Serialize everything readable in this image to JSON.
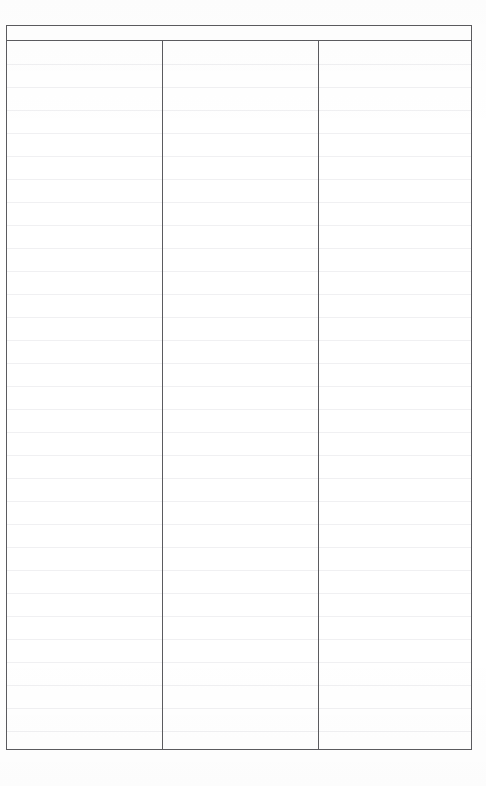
{
  "document": {
    "kind": "blank-ruled-table-form",
    "page_background": "#ffffff",
    "border_color": "#5b5b5f",
    "rule_color": "#f0f0f2",
    "width_px": 486,
    "height_px": 786
  },
  "table": {
    "header": {
      "cells": [
        {
          "label": ""
        },
        {
          "label": ""
        },
        {
          "label": ""
        }
      ]
    },
    "columns": [
      {
        "name": "column-1",
        "content": ""
      },
      {
        "name": "column-2",
        "content": ""
      },
      {
        "name": "column-3",
        "content": ""
      }
    ],
    "body": {
      "rule_count": 31,
      "rule_spacing_px": 23,
      "rows": []
    }
  }
}
